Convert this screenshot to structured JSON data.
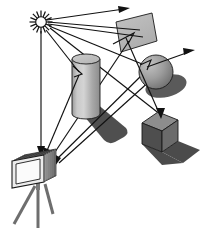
{
  "figure": {
    "background_color": "#ffffff",
    "width": 202,
    "height": 232
  },
  "palette": {
    "ink": "#111111",
    "light_source_core": "#fdfdfd",
    "light_source_spikes": "#141414",
    "mirror_face": "#b8b8b8",
    "mirror_face_edge": "#a8a8a8",
    "cylinder_body_light": "#d2d2d2",
    "cylinder_body_mid": "#a6a6a6",
    "cylinder_body_dark": "#8a8a8a",
    "cylinder_top": "#c4c4c4",
    "sphere_light": "#b5b5b5",
    "sphere_dark": "#6f6f6f",
    "cube_top": "#8f8f8f",
    "cube_left": "#4e4e4e",
    "cube_right": "#6a6a6a",
    "shadow_dark": "#4a4a4a",
    "shadow_mid": "#5c5c5c",
    "camera_body": "#d8d8d8",
    "camera_film_stack": "#9b9b9b",
    "camera_front_face": "#ededed",
    "tripod_leg": "#6e6e6e"
  },
  "elements": {
    "light_source": {
      "name": "light source",
      "icon": "sun-starburst-icon",
      "center_x": 41,
      "center_y": 22,
      "core_radius": 5.2,
      "spike_count": 16,
      "spike_outer_radius": 11.5
    },
    "mirror": {
      "name": "mirror / specular quad",
      "points": "116,22 152,13 156,41 120,52"
    },
    "cylinder": {
      "name": "cylinder",
      "center_x": 86,
      "top_y": 59,
      "bottom_y": 114,
      "radius_x": 14,
      "radius_y": 5
    },
    "sphere": {
      "name": "sphere",
      "center_x": 156,
      "center_y": 72,
      "radius": 17
    },
    "cube": {
      "name": "cube",
      "top_face": "158,112 178,120 162,131 142,123",
      "left_face": "142,123 162,131 162,152 142,144",
      "right_face": "162,131 178,120 178,141 162,152"
    },
    "camera": {
      "name": "camera with film plane stack",
      "film_planes": 6,
      "tripod_legs": 3,
      "body_x": 12,
      "body_y": 155
    },
    "shadows": [
      {
        "name": "cylinder-shadow"
      },
      {
        "name": "sphere-shadow"
      },
      {
        "name": "cube-shadow"
      }
    ]
  },
  "rays": {
    "count_total": 10,
    "to_camera_count": 4,
    "escaping_count": 2,
    "labels": {
      "primary": "light ray from source",
      "reflected": "reflected ray",
      "to_eye": "ray reaching camera film plane",
      "escaping": "ray escaping the scene"
    },
    "paths": [
      {
        "name": "sun-to-mirror-top-reflect-out",
        "d": "M47,20 L125,9"
      },
      {
        "name": "sun-to-mirror",
        "d": "M48,22 L139,30"
      },
      {
        "name": "sun-to-mirror-2",
        "d": "M48,24 L142,36"
      },
      {
        "name": "sun-to-sphere-reflect-out",
        "d": "M49,26 L146,66 L192,52"
      },
      {
        "name": "sun-to-cube",
        "d": "M50,28 L160,116"
      },
      {
        "name": "sun-down-to-camera",
        "d": "M41,30 L41,154"
      },
      {
        "name": "sun-to-cylinder-to-camera",
        "d": "M46,30 L79,73 L45,157"
      },
      {
        "name": "mirror-to-camera",
        "d": "M128,40 L50,159"
      },
      {
        "name": "sphere-to-camera",
        "d": "M146,70 L54,162"
      },
      {
        "name": "long-to-camera",
        "d": "M150,76 L58,164"
      }
    ]
  }
}
